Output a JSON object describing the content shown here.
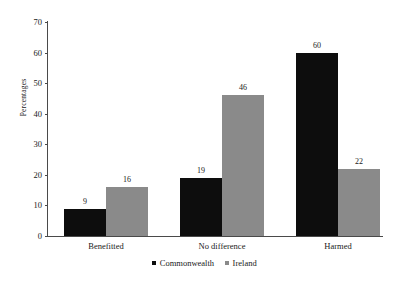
{
  "chart_data": {
    "type": "bar",
    "title": "",
    "subtitle": "",
    "xlabel": "",
    "ylabel": "Percentages",
    "ylim": [
      0,
      70
    ],
    "ytick_step": 10,
    "yticks": [
      0,
      10,
      20,
      30,
      40,
      50,
      60,
      70
    ],
    "grid": false,
    "legend_position": "bottom-center",
    "categories": [
      "Benefitted",
      "No difference",
      "Harmed"
    ],
    "series": [
      {
        "name": "Commonwealth",
        "color": "#0d0d0d",
        "values": [
          9,
          19,
          60
        ]
      },
      {
        "name": "Ireland",
        "color": "#8a8a8a",
        "values": [
          16,
          46,
          22
        ]
      }
    ],
    "value_labels": [
      [
        "9",
        "19",
        "60"
      ],
      [
        "16",
        "46",
        "22"
      ]
    ]
  },
  "legend": {
    "items": [
      {
        "label": "Commonwealth",
        "marker": "square-marker-black"
      },
      {
        "label": "Ireland",
        "marker": "square-marker-gray"
      }
    ]
  },
  "axes": {
    "y_title": "Percentages",
    "y_tick_labels": [
      "70",
      "60",
      "50",
      "40",
      "30",
      "20",
      "10",
      "0"
    ],
    "x_tick_labels": [
      "Benefitted",
      "No difference",
      "Harmed"
    ]
  }
}
